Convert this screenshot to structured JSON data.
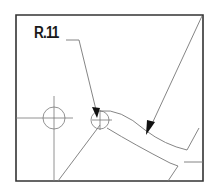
{
  "drawing": {
    "dimension_label": "R.11",
    "colors": {
      "border": "#333333",
      "line": "#777777",
      "arrow": "#111111",
      "background": "#ffffff"
    }
  }
}
